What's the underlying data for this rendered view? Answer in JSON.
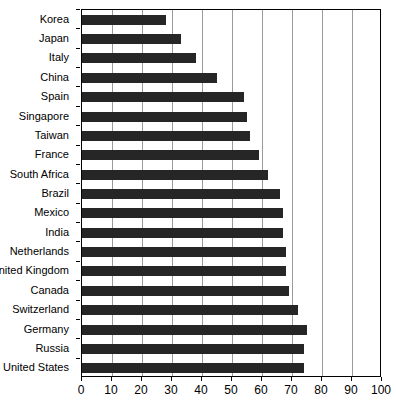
{
  "chart_data": {
    "type": "bar",
    "orientation": "horizontal",
    "title": "",
    "xlabel": "",
    "ylabel": "",
    "xlim": [
      0,
      100
    ],
    "xticks": [
      0,
      10,
      20,
      30,
      40,
      50,
      60,
      70,
      80,
      90,
      100
    ],
    "grid": "vertical",
    "legend": "none",
    "bar_color": "#262626",
    "categories": [
      "Korea",
      "Japan",
      "Italy",
      "China",
      "Spain",
      "Singapore",
      "Taiwan",
      "France",
      "South Africa",
      "Brazil",
      "Mexico",
      "India",
      "Netherlands",
      "United Kingdom",
      "Canada",
      "Switzerland",
      "Germany",
      "Russia",
      "United States"
    ],
    "values": [
      28,
      33,
      38,
      45,
      54,
      55,
      56,
      59,
      62,
      66,
      67,
      67,
      68,
      68,
      69,
      72,
      75,
      74,
      74
    ]
  }
}
